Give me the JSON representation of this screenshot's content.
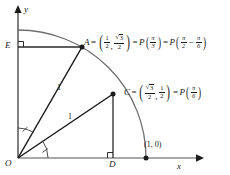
{
  "figure": {
    "type": "unit-circle-diagram",
    "background": "#ffffff",
    "stroke_dark": "#1a1a1a",
    "stroke_gray": "#8c8c8c",
    "axes": {
      "x_label": "x",
      "y_label": "y",
      "origin_label": "O"
    },
    "points": {
      "origin": {
        "label": "O",
        "x": 0,
        "y": 0
      },
      "A": {
        "label": "A",
        "coords": {
          "x_num": "1",
          "x_den": "2",
          "y_num": "√3",
          "y_den": "2"
        },
        "angle_1": {
          "num": "π",
          "den": "3"
        },
        "angle_2_a": {
          "num": "π",
          "den": "2"
        },
        "angle_2_b": {
          "num": "π",
          "den": "6"
        },
        "minus": "−",
        "equals": "=",
        "comma": ",",
        "P": "P"
      },
      "C": {
        "label": "C",
        "coords": {
          "x_num": "√3",
          "x_den": "2",
          "y_num": "1",
          "y_den": "2"
        },
        "angle": {
          "num": "π",
          "den": "6"
        },
        "equals": "=",
        "comma": ",",
        "P": "P"
      },
      "D": {
        "label": "D"
      },
      "E": {
        "label": "E"
      },
      "unit": {
        "label": "(1, 0)"
      }
    },
    "segments": {
      "OA_length": "1",
      "OC_length": "1"
    }
  }
}
